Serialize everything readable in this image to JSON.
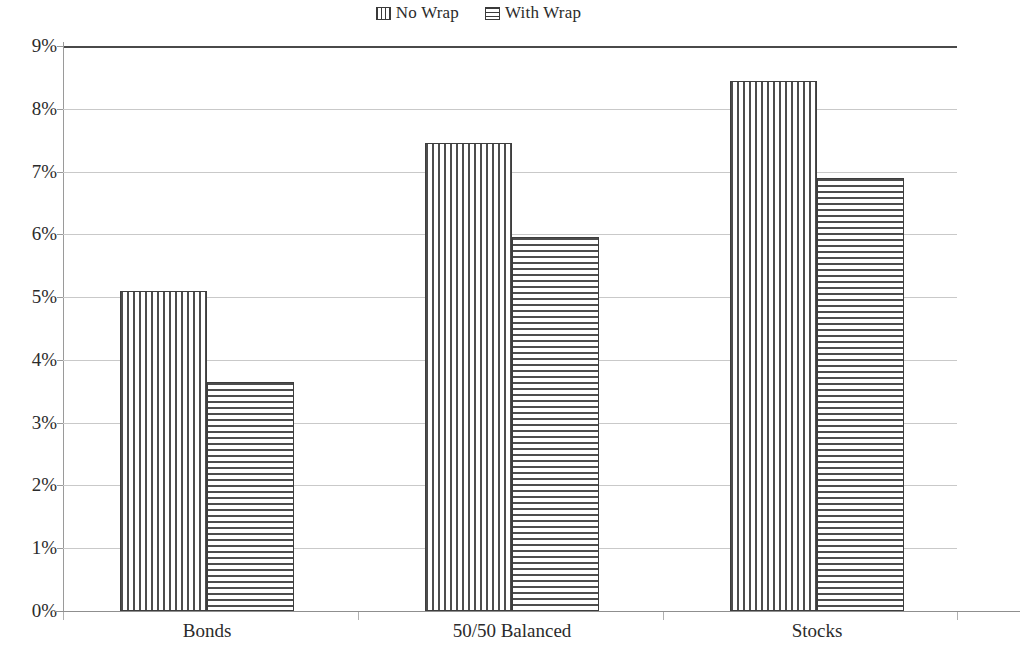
{
  "chart_data": {
    "type": "bar",
    "title": "",
    "subtitle": "",
    "xlabel": "",
    "ylabel": "",
    "categories": [
      "Bonds",
      "50/50 Balanced",
      "Stocks"
    ],
    "series": [
      {
        "name": "No Wrap",
        "pattern": "vertical-lines",
        "values": [
          5.1,
          7.45,
          8.45
        ],
        "value_labels": [
          "5.1%",
          "7.45%",
          "8.45%"
        ]
      },
      {
        "name": "With Wrap",
        "pattern": "horizontal-lines",
        "values": [
          3.65,
          5.95,
          6.9
        ],
        "value_labels": [
          "3.65%",
          "5.95%",
          "6.9%"
        ]
      }
    ],
    "ylim": [
      0,
      9
    ],
    "ytick_step": 1,
    "ytick_values": [
      0,
      1,
      2,
      3,
      4,
      5,
      6,
      7,
      8,
      9
    ],
    "ytick_labels": [
      "0%",
      "1%",
      "2%",
      "3%",
      "4%",
      "5%",
      "6%",
      "7%",
      "8%",
      "9%"
    ],
    "grid": true,
    "grid_axis": "y",
    "legend_position": "top-center",
    "colors": {
      "ink": "#2b2b2b",
      "bar_outline": "#3d3d3d",
      "bar_hatch": "#4d4d4d",
      "gridline": "#c9c9c9",
      "axis": "#9a9a9a",
      "plot_top_border": "#4a4a4a",
      "background": "#ffffff"
    }
  },
  "legend": {
    "entries": [
      {
        "label": "No Wrap",
        "swatch": "vertical-stripes-swatch"
      },
      {
        "label": "With Wrap",
        "swatch": "horizontal-stripes-swatch"
      }
    ]
  }
}
